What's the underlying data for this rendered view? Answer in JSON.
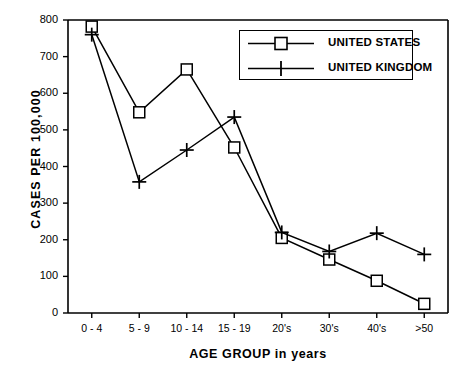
{
  "chart_data": {
    "type": "line",
    "title": "",
    "xlabel": "AGE GROUP in years",
    "ylabel": "CASES PER 100,000",
    "categories": [
      "0 - 4",
      "5 - 9",
      "10 - 14",
      "15 - 19",
      "20's",
      "30's",
      "40's",
      ">50"
    ],
    "ylim": [
      0,
      800
    ],
    "yticks": [
      "0",
      "100",
      "200",
      "300",
      "400",
      "500",
      "600",
      "700",
      "800"
    ],
    "ytick_values": [
      0,
      100,
      200,
      300,
      400,
      500,
      600,
      700,
      800
    ],
    "grid": false,
    "legend_position": "top-right",
    "series": [
      {
        "name": "UNITED STATES",
        "marker": "square",
        "values": [
          782,
          548,
          665,
          452,
          205,
          146,
          88,
          25
        ]
      },
      {
        "name": "UNITED KINGDOM",
        "marker": "plus",
        "values": [
          760,
          358,
          445,
          535,
          220,
          168,
          218,
          160
        ]
      }
    ]
  },
  "axes": {
    "ylabel": "CASES PER 100,000",
    "xlabel": "AGE GROUP in years"
  },
  "legend": {
    "items": [
      {
        "label": "UNITED STATES",
        "marker": "square-marker-icon"
      },
      {
        "label": "UNITED KINGDOM",
        "marker": "plus-marker-icon"
      }
    ]
  }
}
